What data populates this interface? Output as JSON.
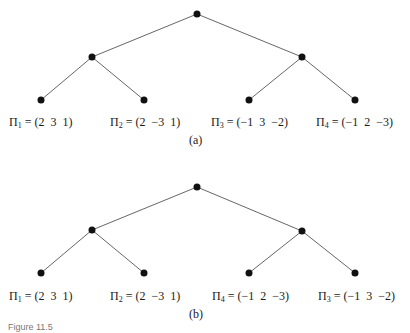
{
  "diagrams": [
    {
      "caption": "(a)",
      "labels": [
        {
          "sym": "Π",
          "sub": "1",
          "value": " = (2  3  1)"
        },
        {
          "sym": "Π",
          "sub": "2",
          "value": " = (2  −3  1)"
        },
        {
          "sym": "Π",
          "sub": "3",
          "value": " = (−1  3  −2)"
        },
        {
          "sym": "Π",
          "sub": "4",
          "value": " = (−1  2  −3)"
        }
      ]
    },
    {
      "caption": "(b)",
      "labels": [
        {
          "sym": "Π",
          "sub": "1",
          "value": " = (2  3  1)"
        },
        {
          "sym": "Π",
          "sub": "2",
          "value": " = (2  −3  1)"
        },
        {
          "sym": "Π",
          "sub": "4",
          "value": " = (−1  2  −3)"
        },
        {
          "sym": "Π",
          "sub": "3",
          "value": " = (−1  3  −2)"
        }
      ]
    }
  ],
  "figure_caption": "Figure 11.5"
}
